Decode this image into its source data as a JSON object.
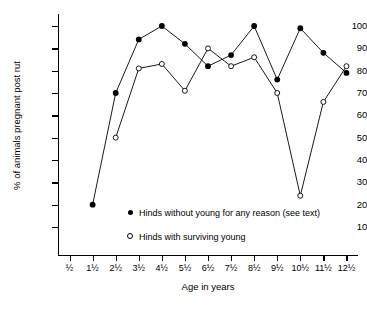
{
  "chart_data": {
    "type": "line",
    "title": "",
    "xlabel": "Age in years",
    "ylabel": "% of animals pregnant post rut",
    "categories": [
      "½",
      "1½",
      "2½",
      "3½",
      "4½",
      "5½",
      "6½",
      "7½",
      "8½",
      "9½",
      "10½",
      "11½",
      "12½"
    ],
    "x": [
      0.5,
      1.5,
      2.5,
      3.5,
      4.5,
      5.5,
      6.5,
      7.5,
      8.5,
      9.5,
      10.5,
      11.5,
      12.5
    ],
    "ylim": [
      0,
      105
    ],
    "xlim": [
      0.0,
      13.0
    ],
    "yticks": [
      10,
      20,
      30,
      40,
      50,
      60,
      70,
      80,
      90,
      100
    ],
    "grid": false,
    "legend_position": "inside-lower-center",
    "series": [
      {
        "name": "Hinds without young for any reason (see text)",
        "marker": "filled-circle",
        "color": "#000000",
        "x": [
          1.5,
          2.5,
          3.5,
          4.5,
          5.5,
          6.5,
          7.5,
          8.5,
          9.5,
          10.5,
          11.5,
          12.5
        ],
        "values": [
          20,
          70,
          94,
          100,
          92,
          82,
          87,
          100,
          76,
          99,
          88,
          79
        ]
      },
      {
        "name": "Hinds with surviving young",
        "marker": "open-circle",
        "color": "#000000",
        "x": [
          2.5,
          3.5,
          4.5,
          5.5,
          6.5,
          7.5,
          8.5,
          9.5,
          10.5,
          11.5,
          12.5
        ],
        "values": [
          50,
          81,
          83,
          71,
          90,
          82,
          86,
          70,
          24,
          66,
          82
        ]
      }
    ]
  },
  "axes": {
    "y_title": "% of animals pregnant post rut",
    "x_title": "Age in years",
    "y_tick_labels": [
      "10",
      "20",
      "30",
      "40",
      "50",
      "60",
      "70",
      "80",
      "90",
      "100"
    ],
    "x_tick_labels": [
      "½",
      "1½",
      "2½",
      "3½",
      "4½",
      "5½",
      "6½",
      "7½",
      "8½",
      "9½",
      "10½",
      "11½",
      "12½"
    ]
  },
  "legend": {
    "entries": [
      {
        "marker": "filled-circle",
        "label": "Hinds without young for any reason (see text)"
      },
      {
        "marker": "open-circle",
        "label": "Hinds with surviving young"
      }
    ]
  }
}
